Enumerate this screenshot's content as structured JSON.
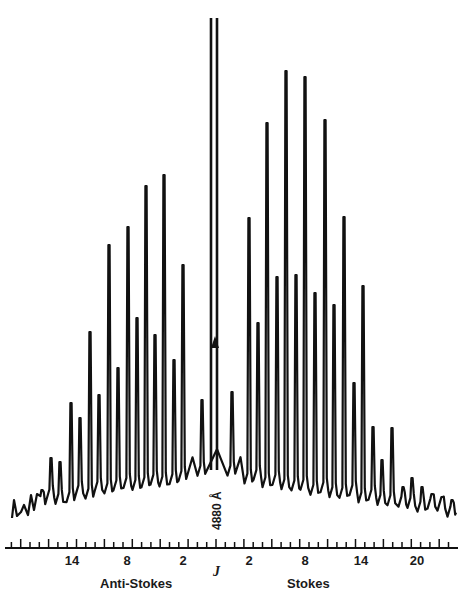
{
  "chart_data": {
    "type": "line",
    "title": "",
    "xlabel": "J",
    "ylabel": "",
    "grid": false,
    "legend": null,
    "annotations": [
      {
        "text": "4880 Å",
        "position": "center, rotated vertical, below central line"
      },
      {
        "text": "▲",
        "position": "marker on central Rayleigh line"
      }
    ],
    "side_labels": {
      "left": "Anti-Stokes",
      "right": "Stokes"
    },
    "x_ticks": {
      "anti_stokes": [
        "14",
        "8",
        "2"
      ],
      "stokes": [
        "2",
        "8",
        "14",
        "20"
      ]
    },
    "center_line": {
      "label": "4880 Å",
      "truncated": true
    },
    "anti_stokes_peaks": {
      "J": [
        2,
        3,
        4,
        5,
        6,
        7,
        8,
        9,
        10,
        11,
        12,
        13,
        14,
        15,
        16,
        17,
        18,
        19,
        20
      ],
      "relative_height": [
        0.53,
        0.23,
        0.61,
        0.28,
        0.63,
        0.32,
        0.58,
        0.24,
        0.55,
        0.37,
        0.28,
        0.19,
        0.2,
        0.12,
        0.1,
        0.08,
        0.07,
        0.06,
        0.05
      ]
    },
    "stokes_peaks": {
      "J": [
        2,
        3,
        4,
        5,
        6,
        7,
        8,
        9,
        10,
        11,
        12,
        13,
        14,
        15,
        16,
        17,
        18,
        19,
        20
      ],
      "relative_height": [
        0.52,
        0.3,
        0.77,
        0.4,
        0.88,
        0.4,
        0.86,
        0.37,
        0.77,
        0.34,
        0.56,
        0.19,
        0.33,
        0.11,
        0.16,
        0.07,
        0.1,
        0.05,
        0.04
      ]
    }
  },
  "labels": {
    "axis_name": "J",
    "left_side": "Anti-Stokes",
    "right_side": "Stokes",
    "wavelength": "4880 Å",
    "ticks": [
      {
        "text": "14",
        "x": 72
      },
      {
        "text": "8",
        "x": 127
      },
      {
        "text": "2",
        "x": 183
      },
      {
        "text": "2",
        "x": 249
      },
      {
        "text": "8",
        "x": 305
      },
      {
        "text": "14",
        "x": 361
      },
      {
        "text": "20",
        "x": 417
      }
    ]
  },
  "layout": {
    "center_x": 216,
    "tick_spacing": 9.3,
    "axis_y": 548,
    "peaks_px": [
      [
        42,
        490
      ],
      [
        51,
        458
      ],
      [
        60,
        462
      ],
      [
        71,
        403
      ],
      [
        80,
        418
      ],
      [
        90,
        332
      ],
      [
        99,
        395
      ],
      [
        109,
        245
      ],
      [
        118,
        368
      ],
      [
        128,
        227
      ],
      [
        137,
        318
      ],
      [
        146,
        186
      ],
      [
        155,
        335
      ],
      [
        164,
        175
      ],
      [
        174,
        360
      ],
      [
        183,
        265
      ],
      [
        202,
        400
      ],
      [
        232,
        392
      ],
      [
        249,
        218
      ],
      [
        258,
        323
      ],
      [
        267,
        123
      ],
      [
        277,
        277
      ],
      [
        286,
        71
      ],
      [
        296,
        275
      ],
      [
        305,
        77
      ],
      [
        315,
        293
      ],
      [
        325,
        120
      ],
      [
        334,
        305
      ],
      [
        344,
        217
      ],
      [
        354,
        383
      ],
      [
        363,
        286
      ],
      [
        373,
        427
      ],
      [
        382,
        460
      ],
      [
        392,
        428
      ],
      [
        403,
        487
      ],
      [
        412,
        478
      ],
      [
        422,
        487
      ],
      [
        432,
        494
      ],
      [
        442,
        497
      ],
      [
        452,
        500
      ]
    ]
  }
}
